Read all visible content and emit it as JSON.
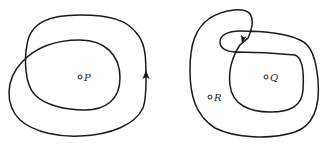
{
  "figure": {
    "left_diagram": {
      "description": "Closed curve winding twice around point P",
      "points": [
        {
          "label": "P",
          "x": 80,
          "y": 77
        }
      ],
      "arrow_direction": "up"
    },
    "right_diagram": {
      "description": "Closed curve with a twist that encloses Q twice and R once",
      "points": [
        {
          "label": "Q",
          "x": 266,
          "y": 77
        },
        {
          "label": "R",
          "x": 210,
          "y": 97
        }
      ],
      "arrow_direction": "down-left"
    },
    "colors": {
      "stroke": "#1a1a1a",
      "background": "#ffffff"
    }
  }
}
